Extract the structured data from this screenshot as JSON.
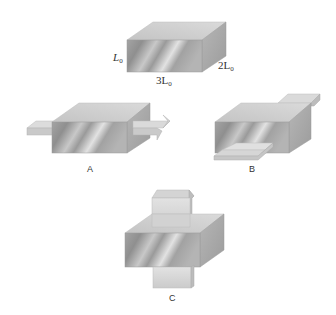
{
  "figure": {
    "top_box": {
      "labels": {
        "height": "L",
        "height_sub": "0",
        "length": "3L",
        "length_sub": "0",
        "depth": "2L",
        "depth_sub": "0"
      }
    },
    "panels": [
      {
        "id": "A",
        "caption": "A"
      },
      {
        "id": "B",
        "caption": "B"
      },
      {
        "id": "C",
        "caption": "C"
      }
    ],
    "colors": {
      "front_dark": "#8e8e8e",
      "front_light": "#e4e4e4",
      "top": "#cfcfcf",
      "side": "#a9a9a9",
      "plate": "#d6d6d6",
      "plate_edge": "#b8b8b8"
    }
  }
}
